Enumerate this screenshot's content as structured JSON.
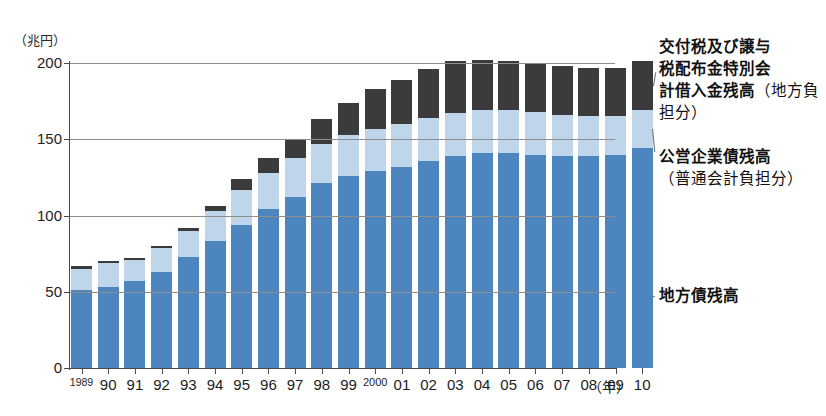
{
  "chart": {
    "type": "bar",
    "y_unit_label": "（兆円）",
    "x_unit_label": "（年）"
  },
  "axis": {
    "y_ticks": [
      "0",
      "50",
      "100",
      "150",
      "200"
    ],
    "y_values": [
      0,
      50,
      100,
      150,
      200
    ],
    "x_labels": [
      "1989",
      "90",
      "91",
      "92",
      "93",
      "94",
      "95",
      "96",
      "97",
      "98",
      "99",
      "2000",
      "01",
      "02",
      "03",
      "04",
      "05",
      "06",
      "07",
      "08",
      "09",
      "10"
    ]
  },
  "legend": {
    "items": [
      {
        "id": "shakkin",
        "label": "交付税及び譲与\n税配布金特別会\n計借入金残高",
        "sub": "（地方負担分）",
        "color": "#3b3b3b"
      },
      {
        "id": "kouei",
        "label": "公営企業債残高",
        "sub": "（普通会計負担分）",
        "color": "#bed5ea"
      },
      {
        "id": "chihosai",
        "label": "地方債残高",
        "sub": "",
        "color": "#4d85bf"
      }
    ]
  },
  "chart_data": {
    "type": "bar",
    "title": "",
    "subtitle": "",
    "xlabel": "（年）",
    "ylabel": "（兆円）",
    "ylim": [
      0,
      200
    ],
    "grid": true,
    "stacked": true,
    "legend_position": "right",
    "categories": [
      "1989",
      "90",
      "91",
      "92",
      "93",
      "94",
      "95",
      "96",
      "97",
      "98",
      "99",
      "2000",
      "01",
      "02",
      "03",
      "04",
      "05",
      "06",
      "07",
      "08",
      "09",
      "10"
    ],
    "series": [
      {
        "name": "地方債残高",
        "color": "#4d85bf",
        "values": [
          51,
          53,
          57,
          63,
          73,
          83,
          94,
          104,
          112,
          121,
          126,
          129,
          132,
          136,
          139,
          141,
          141,
          140,
          139,
          139,
          140,
          144
        ]
      },
      {
        "name": "公営企業債残高（普通会計負担分）",
        "color": "#bed5ea",
        "values": [
          14,
          16,
          14,
          16,
          17,
          20,
          23,
          24,
          26,
          26,
          27,
          28,
          28,
          28,
          28,
          28,
          28,
          28,
          27,
          26,
          25,
          25
        ]
      },
      {
        "name": "交付税及び譲与税配布金特別会計借入金残高（地方負担分）",
        "color": "#3b3b3b",
        "values": [
          2,
          1,
          1,
          1,
          2,
          3,
          7,
          10,
          12,
          16,
          21,
          26,
          29,
          32,
          34,
          33,
          32,
          32,
          32,
          32,
          32,
          32
        ]
      }
    ],
    "totals": [
      67,
      70,
      72,
      80,
      92,
      106,
      124,
      138,
      150,
      163,
      174,
      183,
      189,
      196,
      201,
      202,
      201,
      200,
      198,
      197,
      197,
      201
    ]
  }
}
